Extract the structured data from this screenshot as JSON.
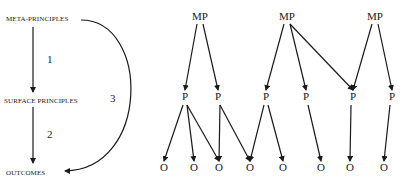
{
  "left_diagram": {
    "levels": [
      {
        "id": "meta",
        "label": "META-PRINCIPLES",
        "x": 6,
        "y": 19
      },
      {
        "id": "surface",
        "label": "SURFACE PRINCIPLES",
        "x": 4,
        "y": 101
      },
      {
        "id": "outcomes",
        "label": "OUTCOMES",
        "x": 6,
        "y": 173
      }
    ],
    "arrows": [
      {
        "label": "1",
        "from": "meta",
        "to": "surface"
      },
      {
        "label": "2",
        "from": "surface",
        "to": "outcomes"
      },
      {
        "label": "3",
        "from": "meta",
        "to": "outcomes",
        "curved": true
      }
    ]
  },
  "right_diagram": {
    "mp_label": "MP",
    "p_label": "P",
    "o_label": "O",
    "mp_nodes": [
      200,
      287,
      375
    ],
    "p_nodes": [
      185,
      218,
      266,
      306,
      353,
      392
    ],
    "o_nodes": [
      164,
      194,
      219,
      250,
      283,
      321,
      350,
      384
    ],
    "mp_to_p": [
      [
        0,
        0
      ],
      [
        0,
        1
      ],
      [
        1,
        2
      ],
      [
        1,
        3
      ],
      [
        1,
        4
      ],
      [
        2,
        4
      ],
      [
        2,
        5
      ]
    ],
    "p_to_o": [
      [
        0,
        0
      ],
      [
        0,
        1
      ],
      [
        0,
        2
      ],
      [
        1,
        2
      ],
      [
        1,
        3
      ],
      [
        2,
        3
      ],
      [
        2,
        4
      ],
      [
        3,
        5
      ],
      [
        4,
        6
      ],
      [
        5,
        7
      ]
    ]
  }
}
